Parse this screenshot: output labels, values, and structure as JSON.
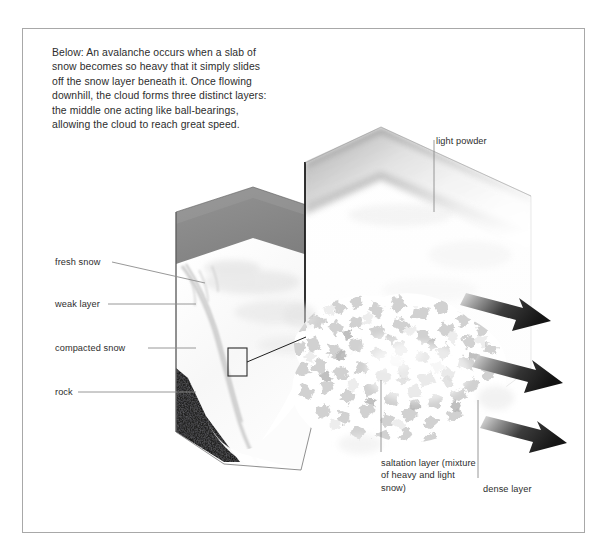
{
  "figure": {
    "caption": "Below: An avalanche occurs when a slab of snow becomes so heavy that it simply slides off the snow layer beneath it. Once flowing downhill, the cloud forms three distinct layers: the middle one acting like ball-bearings, allowing the cloud to reach great speed.",
    "background_color": "#ffffff",
    "frame_color": "#a8a8a8",
    "label_color": "#2d2d2d",
    "leader_line_color": "#8c8c8c"
  },
  "labels": {
    "fresh_snow": "fresh snow",
    "weak_layer": "weak layer",
    "compacted_snow": "compacted snow",
    "rock": "rock",
    "light_powder": "light powder",
    "saltation_layer": "saltation layer (mixture of heavy and light snow)",
    "dense_layer": "dense layer"
  },
  "diagram": {
    "snow_block": {
      "top_face_color": "#8a8a8a",
      "snow_color": "#fbfbfb",
      "rock_color": "#262626",
      "outline_color": "#3a3a3a"
    },
    "cloud_panel": {
      "powder_gradient_from": "#9a9a9a",
      "powder_gradient_to": "#ffffff",
      "crystal_color": "#d6d6d6",
      "outline_color": "#1e1e1e"
    },
    "arrows": {
      "count": 3,
      "head_color": "#1a1a1a",
      "tail_color": "#d9d9d9",
      "direction": "down-right"
    },
    "detail_callout": {
      "shape": "rectangle",
      "stroke_color": "#2b2b2b"
    }
  }
}
